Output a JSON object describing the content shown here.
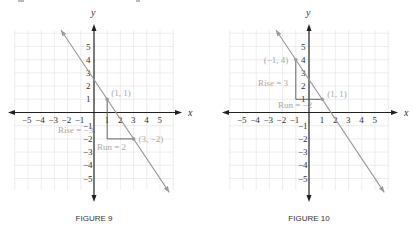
{
  "chart_data": [
    {
      "type": "line",
      "title": "FIGURE 9",
      "xlabel": "x",
      "ylabel": "y",
      "xlim": [
        -6,
        6
      ],
      "ylim": [
        -6,
        6
      ],
      "grid": true,
      "x_ticks": [
        -5,
        -4,
        -3,
        -2,
        -1,
        1,
        2,
        3,
        4,
        5
      ],
      "y_ticks": [
        5,
        4,
        3,
        2,
        1,
        -1,
        -2,
        -3,
        -4,
        -5
      ],
      "tick_labels_x": [
        "−5",
        "−4",
        "−3",
        "−2",
        "−1",
        "1",
        "2",
        "3",
        "4",
        "5"
      ],
      "tick_labels_y": [
        "5",
        "4",
        "3",
        "2",
        "1",
        "−1",
        "−2",
        "−3",
        "−4",
        "−5"
      ],
      "series": [
        {
          "name": "line",
          "slope": -1.5,
          "intercept": 2.5,
          "x": [
            -2.5,
            5.7
          ],
          "y": [
            6.25,
            -6.05
          ]
        }
      ],
      "points": [
        {
          "x": 1,
          "y": 1,
          "label": "(1, 1)"
        },
        {
          "x": 3,
          "y": -2,
          "label": "(3, −2)"
        }
      ],
      "annotations": [
        {
          "text": "Rise = −3",
          "kind": "rise"
        },
        {
          "text": "Run = 2",
          "kind": "run"
        }
      ],
      "triangle": {
        "from": [
          1,
          1
        ],
        "corner": [
          1,
          -2
        ],
        "to": [
          3,
          -2
        ]
      }
    },
    {
      "type": "line",
      "title": "FIGURE 10",
      "xlabel": "x",
      "ylabel": "y",
      "xlim": [
        -6,
        6
      ],
      "ylim": [
        -6,
        6
      ],
      "grid": true,
      "x_ticks": [
        -5,
        -4,
        -3,
        -2,
        -1,
        1,
        2,
        3,
        4,
        5
      ],
      "y_ticks": [
        5,
        4,
        3,
        2,
        1,
        -1,
        -2,
        -3,
        -4,
        -5
      ],
      "tick_labels_x": [
        "−5",
        "−4",
        "−3",
        "−2",
        "−1",
        "1",
        "2",
        "3",
        "4",
        "5"
      ],
      "tick_labels_y": [
        "5",
        "4",
        "3",
        "2",
        "1",
        "−1",
        "−2",
        "−3",
        "−4",
        "−5"
      ],
      "series": [
        {
          "name": "line",
          "slope": -1.5,
          "intercept": 2.5,
          "x": [
            -2.5,
            5.7
          ],
          "y": [
            6.25,
            -6.05
          ]
        }
      ],
      "points": [
        {
          "x": -1,
          "y": 4,
          "label": "(−1, 4)"
        },
        {
          "x": 1,
          "y": 1,
          "label": "(1, 1)"
        }
      ],
      "annotations": [
        {
          "text": "Rise = 3",
          "kind": "rise"
        },
        {
          "text": "Run = −2",
          "kind": "run"
        }
      ],
      "triangle": {
        "from": [
          1,
          1
        ],
        "corner": [
          -1,
          1
        ],
        "to": [
          -1,
          4
        ]
      }
    }
  ]
}
